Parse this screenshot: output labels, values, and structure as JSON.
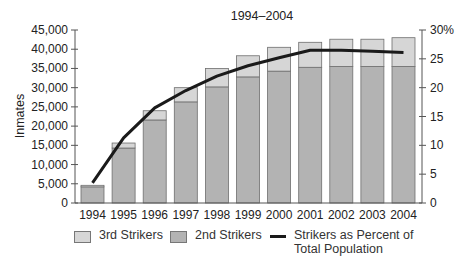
{
  "chart_data": {
    "type": "bar+line",
    "title": "1994–2004",
    "xlabel": "",
    "ylabel": "Inmates",
    "y2label": "",
    "categories": [
      "1994",
      "1995",
      "1996",
      "1997",
      "1998",
      "1999",
      "2000",
      "2001",
      "2002",
      "2003",
      "2004"
    ],
    "stacked": true,
    "series": [
      {
        "name": "2nd Strikers",
        "type": "bar",
        "color": "#b3b3b3",
        "values": [
          4200,
          14300,
          21600,
          26300,
          30200,
          32800,
          34300,
          35300,
          35500,
          35500,
          35500
        ]
      },
      {
        "name": "3rd Strikers",
        "type": "bar",
        "color": "#d6d6d6",
        "values": [
          400,
          1300,
          2400,
          3700,
          4800,
          5500,
          6200,
          6500,
          7100,
          7100,
          7500
        ]
      },
      {
        "name": "Strikers as Percent of Total Population",
        "type": "line",
        "axis": "right",
        "color": "#1a1a1a",
        "values": [
          3.5,
          11.3,
          16.5,
          19.5,
          22.0,
          23.8,
          25.2,
          26.5,
          26.5,
          26.3,
          26.1
        ]
      }
    ],
    "ylim": [
      0,
      45000
    ],
    "y2lim": [
      0,
      30
    ],
    "yticks": [
      "0",
      "5,000",
      "10,000",
      "15,000",
      "20,000",
      "25,000",
      "30,000",
      "35,000",
      "40,000",
      "45,000"
    ],
    "y2ticks": [
      "0",
      "5",
      "10",
      "15",
      "20",
      "25",
      "30%"
    ],
    "grid": false,
    "legend_position": "bottom"
  },
  "legend": {
    "third": "3rd Strikers",
    "second": "2nd Strikers",
    "line_line1": "Strikers as Percent of",
    "line_line2": "Total Population"
  }
}
